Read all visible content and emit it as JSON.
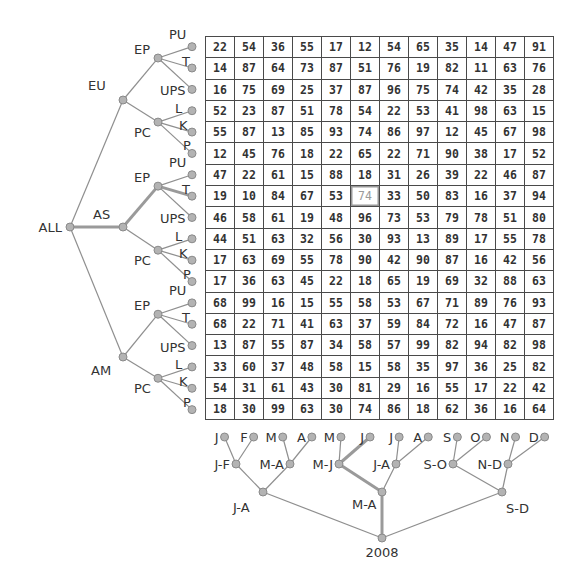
{
  "row_tree": {
    "root": "ALL",
    "regions": [
      {
        "label": "EU",
        "groups": [
          {
            "label": "EP",
            "leaves": [
              "PU",
              "T",
              "UPS"
            ]
          },
          {
            "label": "PC",
            "leaves": [
              "L",
              "K",
              "P"
            ]
          }
        ]
      },
      {
        "label": "AS",
        "groups": [
          {
            "label": "EP",
            "leaves": [
              "PU",
              "T",
              "UPS"
            ]
          },
          {
            "label": "PC",
            "leaves": [
              "L",
              "K",
              "P"
            ]
          }
        ]
      },
      {
        "label": "AM",
        "groups": [
          {
            "label": "EP",
            "leaves": [
              "PU",
              "T",
              "UPS"
            ]
          },
          {
            "label": "PC",
            "leaves": [
              "L",
              "K",
              "P"
            ]
          }
        ]
      }
    ],
    "highlight_path": [
      "ALL",
      "AS",
      "EP",
      "T"
    ]
  },
  "column_tree": {
    "root": "2008",
    "halves": [
      "J-A",
      "M-A",
      "S-D"
    ],
    "pairs": [
      "J-F",
      "M-A",
      "M-J",
      "J-A",
      "S-O",
      "N-D"
    ],
    "months": [
      "J",
      "F",
      "M",
      "A",
      "M",
      "J",
      "J",
      "A",
      "S",
      "O",
      "N",
      "D"
    ],
    "highlight_path": [
      "2008",
      "M-A",
      "M-J",
      "J"
    ]
  },
  "grid": {
    "rows": [
      [
        22,
        54,
        36,
        55,
        17,
        12,
        54,
        65,
        35,
        14,
        47,
        91
      ],
      [
        14,
        87,
        64,
        73,
        87,
        51,
        76,
        19,
        82,
        11,
        63,
        76
      ],
      [
        16,
        75,
        69,
        25,
        37,
        87,
        96,
        75,
        74,
        42,
        35,
        28
      ],
      [
        52,
        23,
        87,
        51,
        78,
        54,
        22,
        53,
        41,
        98,
        63,
        15
      ],
      [
        55,
        87,
        13,
        85,
        93,
        74,
        86,
        97,
        12,
        45,
        67,
        98
      ],
      [
        12,
        45,
        76,
        18,
        22,
        65,
        22,
        71,
        90,
        38,
        17,
        52
      ],
      [
        47,
        22,
        61,
        15,
        88,
        18,
        31,
        26,
        39,
        22,
        46,
        87
      ],
      [
        19,
        10,
        84,
        67,
        53,
        74,
        33,
        50,
        83,
        16,
        37,
        94
      ],
      [
        46,
        58,
        61,
        19,
        48,
        96,
        73,
        53,
        79,
        78,
        51,
        80
      ],
      [
        44,
        51,
        63,
        32,
        56,
        30,
        93,
        13,
        89,
        17,
        55,
        78
      ],
      [
        17,
        63,
        69,
        55,
        78,
        90,
        42,
        90,
        87,
        16,
        42,
        56
      ],
      [
        17,
        36,
        63,
        45,
        22,
        18,
        65,
        19,
        69,
        32,
        88,
        63
      ],
      [
        68,
        99,
        16,
        15,
        55,
        58,
        53,
        67,
        71,
        89,
        76,
        93
      ],
      [
        68,
        22,
        71,
        41,
        63,
        37,
        59,
        84,
        72,
        16,
        47,
        87
      ],
      [
        13,
        87,
        55,
        87,
        34,
        58,
        57,
        99,
        82,
        94,
        82,
        98
      ],
      [
        33,
        60,
        37,
        48,
        58,
        15,
        58,
        35,
        97,
        36,
        25,
        82
      ],
      [
        54,
        31,
        61,
        43,
        30,
        81,
        29,
        16,
        55,
        17,
        22,
        42
      ],
      [
        18,
        30,
        99,
        63,
        30,
        74,
        86,
        18,
        62,
        36,
        16,
        64
      ]
    ],
    "selected_cell": {
      "row": 7,
      "col": 5,
      "value": 74
    }
  },
  "colors": {
    "node_fill": "#b3b3b3",
    "edge": "#8f8f8f",
    "grid_border": "#4a4a4a",
    "text": "#333333",
    "selected_text": "#9a9a9a"
  }
}
